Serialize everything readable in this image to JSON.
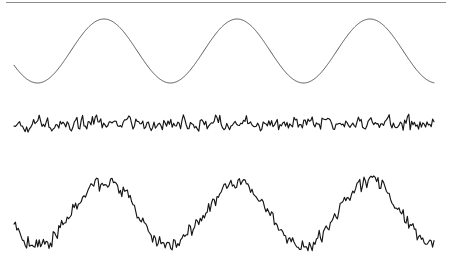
{
  "figure": {
    "title": "",
    "background_color": "#ffffff",
    "width": 449,
    "height": 272,
    "top_rule": {
      "name": "top-horizontal-rule",
      "color": "#8c8c8c",
      "x_start": 6,
      "x_end": 446,
      "y": 2.5,
      "thickness": 1.1
    }
  },
  "chart_data": {
    "type": "line",
    "title": "",
    "xlabel": "",
    "ylabel": "",
    "grid": false,
    "legend_position": "none",
    "x_range": [
      0,
      1
    ],
    "panels": [
      {
        "name": "clean-sine-wave",
        "label": "Clean sine wave",
        "color": "#595959",
        "stroke_width": 1.0,
        "x_start": 14,
        "x_end": 434,
        "baseline_y": 51,
        "amplitude": 32,
        "period_px": 133,
        "phase_offset_px": 104,
        "noise_amplitude": 0,
        "peaks_x": [
          104,
          237,
          370
        ],
        "troughs_x": [
          44,
          177,
          310
        ],
        "peak_y": 19,
        "trough_y": 83,
        "samples": 600,
        "seed": 1
      },
      {
        "name": "pure-noise",
        "label": "Pure noise",
        "color": "#161616",
        "stroke_width": 1.15,
        "x_start": 14,
        "x_end": 434,
        "baseline_y": 124,
        "amplitude": 0,
        "period_px": 133,
        "phase_offset_px": 104,
        "noise_amplitude": 11,
        "peaks_x": [],
        "troughs_x": [],
        "peak_y": 108,
        "trough_y": 141,
        "samples": 300,
        "seed": 7
      },
      {
        "name": "sine-plus-noise",
        "label": "Sine wave plus noise",
        "color": "#161616",
        "stroke_width": 1.15,
        "x_start": 14,
        "x_end": 434,
        "baseline_y": 214,
        "amplitude": 32,
        "period_px": 133,
        "phase_offset_px": 104,
        "noise_amplitude": 11,
        "peaks_x": [
          104,
          237,
          370
        ],
        "troughs_x": [
          44,
          177,
          310
        ],
        "peak_y": 166,
        "trough_y": 262,
        "samples": 300,
        "seed": 23
      }
    ]
  }
}
